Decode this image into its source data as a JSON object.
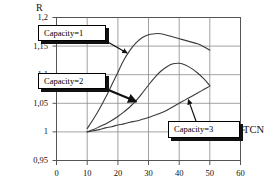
{
  "chart_data": {
    "type": "line",
    "title": "",
    "xlabel": "TCN",
    "ylabel": "R",
    "xlim": [
      0,
      60
    ],
    "ylim": [
      0.95,
      1.2
    ],
    "xticks": [
      "0",
      "10",
      "20",
      "30",
      "40",
      "50",
      "60"
    ],
    "yticks": [
      "0,95",
      "1",
      "1,05",
      "1,1",
      "1,15",
      "1,2"
    ],
    "grid": true,
    "legend_position": "annotations-inline",
    "decimal_separator": ",",
    "series": [
      {
        "name": "Capacity=1",
        "x": [
          10,
          12,
          14,
          16,
          18,
          20,
          22,
          24,
          26,
          28,
          30,
          32,
          33,
          34,
          36,
          38,
          40,
          42,
          44,
          46,
          48,
          50
        ],
        "values": [
          1.006,
          1.022,
          1.04,
          1.06,
          1.082,
          1.104,
          1.126,
          1.143,
          1.156,
          1.165,
          1.17,
          1.1715,
          1.172,
          1.1715,
          1.169,
          1.166,
          1.163,
          1.16,
          1.157,
          1.154,
          1.149,
          1.143
        ]
      },
      {
        "name": "Capacity=2",
        "x": [
          10,
          12,
          14,
          16,
          18,
          20,
          22,
          24,
          26,
          28,
          30,
          32,
          34,
          36,
          38,
          40,
          42,
          44,
          46,
          48,
          50
        ],
        "values": [
          1.0,
          1.004,
          1.009,
          1.014,
          1.02,
          1.027,
          1.035,
          1.044,
          1.055,
          1.068,
          1.082,
          1.095,
          1.106,
          1.114,
          1.119,
          1.12,
          1.117,
          1.111,
          1.103,
          1.093,
          1.081
        ]
      },
      {
        "name": "Capacity=3",
        "x": [
          10,
          12,
          14,
          16,
          18,
          20,
          22,
          24,
          26,
          28,
          30,
          32,
          34,
          36,
          38,
          40,
          42,
          44,
          46,
          48,
          50
        ],
        "values": [
          1.0,
          1.002,
          1.004,
          1.007,
          1.009,
          1.012,
          1.014,
          1.017,
          1.019,
          1.022,
          1.025,
          1.029,
          1.033,
          1.038,
          1.044,
          1.05,
          1.056,
          1.062,
          1.068,
          1.074,
          1.08
        ]
      }
    ],
    "annotations": [
      {
        "label": "Capacity=1",
        "points_to_series": "Capacity=1",
        "points_to_x": 23,
        "points_to_y": 1.138
      },
      {
        "label": "Capacity=2",
        "points_to_series": "Capacity=2",
        "points_to_x": 26,
        "points_to_y": 1.053
      },
      {
        "label": "Capacity=3",
        "points_to_series": "Capacity=3",
        "points_to_x": 43,
        "points_to_y": 1.056
      }
    ]
  },
  "axes": {
    "y_axis_name": "R",
    "x_axis_name": "TCN"
  },
  "callouts": {
    "cap1": "Capacity=1",
    "cap2": "Capacity=2",
    "cap3": "Capacity=3"
  },
  "colors": {
    "frame": "#555555",
    "grid": "#888888",
    "curve": "#3a3a3a",
    "callout_border": "#000000",
    "callout_shadow": "#111111",
    "background": "#ffffff"
  }
}
